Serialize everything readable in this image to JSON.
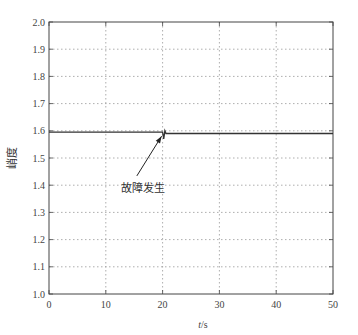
{
  "chart_data": {
    "type": "line",
    "title": "",
    "xlabel": "t/s",
    "ylabel": "峭度",
    "xlim": [
      0,
      50
    ],
    "ylim": [
      1.0,
      2.0
    ],
    "xticks": [
      "0",
      "10",
      "20",
      "30",
      "40",
      "50"
    ],
    "yticks": [
      "1.0",
      "1.1",
      "1.2",
      "1.3",
      "1.4",
      "1.5",
      "1.6",
      "1.7",
      "1.8",
      "1.9",
      "2.0"
    ],
    "grid": true,
    "series": [
      {
        "name": "峭度",
        "x": [
          0,
          20,
          20.2,
          20.4,
          20.6,
          50
        ],
        "values": [
          1.595,
          1.595,
          1.57,
          1.6,
          1.59,
          1.59
        ]
      }
    ],
    "annotations": [
      {
        "text": "故障发生",
        "x": 20,
        "y": 1.595,
        "text_x": 13,
        "text_y": 1.39
      }
    ]
  },
  "axes": {
    "xlabel_italic": "t",
    "xlabel_unit": "/s",
    "ylabel": "峭度"
  },
  "annotation": {
    "text": "故障发生"
  },
  "colors": {
    "line": "#333333",
    "grid": "#999999",
    "axis": "#444444"
  }
}
